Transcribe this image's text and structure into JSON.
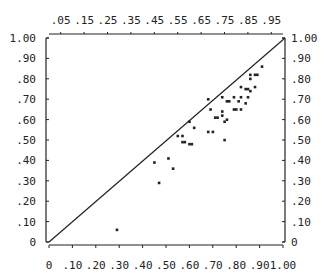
{
  "chart_data": {
    "type": "scatter",
    "title": "",
    "xlabel": "",
    "ylabel": "",
    "xlim": [
      0,
      1.0
    ],
    "ylim": [
      0,
      1.0
    ],
    "grid": false,
    "legend": null,
    "bottom_axis_ticks": [
      "0",
      ".10",
      ".20",
      ".30",
      ".40",
      ".50",
      ".60",
      ".70",
      ".80",
      ".90",
      "1.00"
    ],
    "top_axis_ticks": [
      ".05",
      ".15",
      ".25",
      ".35",
      ".45",
      ".55",
      ".65",
      ".75",
      ".85",
      ".95"
    ],
    "left_axis_ticks": [
      "0",
      ".10",
      ".20",
      ".30",
      ".40",
      ".50",
      ".60",
      ".70",
      ".80",
      ".90",
      "1.00"
    ],
    "right_axis_ticks": [
      "0",
      ".10",
      ".20",
      ".30",
      ".40",
      ".50",
      ".60",
      ".70",
      ".80",
      ".90",
      "1.00"
    ],
    "reference_line": {
      "from": [
        0,
        0
      ],
      "to": [
        1.0,
        1.0
      ],
      "label": "diagonal y = x"
    },
    "points": [
      [
        0.91,
        0.86
      ],
      [
        0.86,
        0.82
      ],
      [
        0.88,
        0.82
      ],
      [
        0.89,
        0.82
      ],
      [
        0.86,
        0.8
      ],
      [
        0.82,
        0.76
      ],
      [
        0.88,
        0.76
      ],
      [
        0.84,
        0.75
      ],
      [
        0.85,
        0.75
      ],
      [
        0.86,
        0.74
      ],
      [
        0.85,
        0.71
      ],
      [
        0.74,
        0.71
      ],
      [
        0.79,
        0.71
      ],
      [
        0.82,
        0.71
      ],
      [
        0.76,
        0.69
      ],
      [
        0.77,
        0.69
      ],
      [
        0.81,
        0.69
      ],
      [
        0.84,
        0.68
      ],
      [
        0.68,
        0.7
      ],
      [
        0.79,
        0.65
      ],
      [
        0.8,
        0.65
      ],
      [
        0.82,
        0.65
      ],
      [
        0.69,
        0.65
      ],
      [
        0.74,
        0.64
      ],
      [
        0.74,
        0.62
      ],
      [
        0.72,
        0.61
      ],
      [
        0.71,
        0.61
      ],
      [
        0.76,
        0.6
      ],
      [
        0.75,
        0.59
      ],
      [
        0.6,
        0.59
      ],
      [
        0.62,
        0.56
      ],
      [
        0.68,
        0.54
      ],
      [
        0.7,
        0.54
      ],
      [
        0.57,
        0.52
      ],
      [
        0.55,
        0.52
      ],
      [
        0.75,
        0.5
      ],
      [
        0.57,
        0.49
      ],
      [
        0.58,
        0.49
      ],
      [
        0.6,
        0.48
      ],
      [
        0.61,
        0.48
      ],
      [
        0.51,
        0.41
      ],
      [
        0.45,
        0.39
      ],
      [
        0.53,
        0.36
      ],
      [
        0.47,
        0.29
      ],
      [
        0.29,
        0.06
      ]
    ]
  },
  "layout": {
    "plot_left_px": 49,
    "plot_right_px": 283,
    "plot_top_px": 38,
    "plot_bottom_px": 242
  },
  "colors": {
    "ink": "#222222",
    "background": "#ffffff"
  }
}
